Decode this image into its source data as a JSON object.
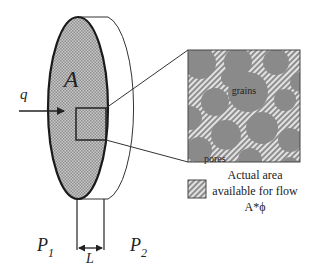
{
  "diagram": {
    "type": "porous-media-flow-schematic",
    "labels": {
      "area": "A",
      "flow_rate": "q",
      "pressure_inlet": "P",
      "pressure_inlet_sub": "1",
      "pressure_outlet": "P",
      "pressure_outlet_sub": "2",
      "length": "L",
      "grains": "grains",
      "pores": "pores"
    },
    "legend": {
      "line1": "Actual area",
      "line2": "available for flow",
      "line3": "A*ϕ"
    },
    "colors": {
      "disk_fill": "#b4b4b4",
      "grain_fill": "#8a8a8a",
      "pore_hatch_light": "#d9d9d9",
      "pore_hatch_dark": "#8a8a8a",
      "outline": "#222222",
      "text": "#222222"
    }
  }
}
